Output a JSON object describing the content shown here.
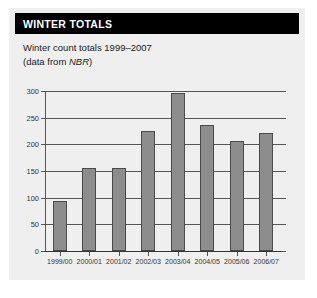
{
  "panel": {
    "title": "WINTER TOTALS",
    "subtitle_line_1": "Winter count totals 1999–2007",
    "subtitle_line_2_prefix": "(data from ",
    "subtitle_line_2_italic": "NBR",
    "subtitle_line_2_suffix": ")",
    "background_color": "#efefef",
    "title_bar_color": "#000000",
    "title_text_color": "#ffffff"
  },
  "chart_data": {
    "type": "bar",
    "title": "WINTER TOTALS",
    "subtitle": "Winter count totals 1999–2007 (data from NBR)",
    "xlabel": "",
    "ylabel": "",
    "categories": [
      "1999/00",
      "2000/01",
      "2001/02",
      "2002/03",
      "2003/04",
      "2004/05",
      "2005/06",
      "2006/07"
    ],
    "values": [
      93,
      155,
      155,
      225,
      297,
      236,
      207,
      221
    ],
    "ylim": [
      0,
      300
    ],
    "yticks": [
      0,
      50,
      100,
      150,
      200,
      250,
      300
    ],
    "ytick_labels": [
      "0",
      "50",
      "100",
      "150",
      "200",
      "250",
      "300"
    ],
    "grid": true,
    "legend": "none",
    "bar_fill_color": "#8d8d8d",
    "bar_border_color": "#4a4a4a",
    "axis_color": "#555555"
  }
}
